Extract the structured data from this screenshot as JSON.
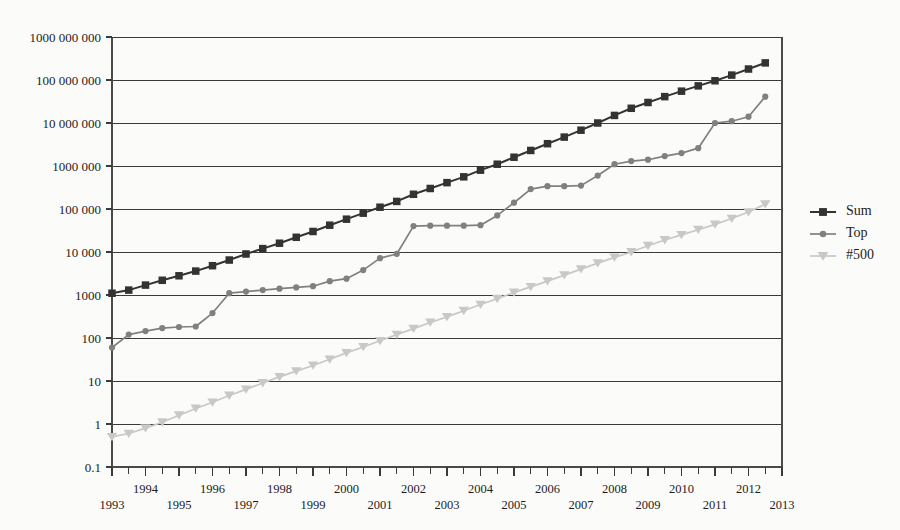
{
  "chart_data": {
    "type": "line",
    "title": "",
    "subtitle": "",
    "xlabel": "",
    "ylabel": "",
    "yscale": "log",
    "ylim": [
      0.1,
      1000000000
    ],
    "xlim": [
      1993,
      2013
    ],
    "grid": "horizontal",
    "legend_position": "right",
    "y_tick_labels": [
      "1000 000 000",
      "100 000 000",
      "10 000 000",
      "1000 000",
      "100 000",
      "10 000",
      "1000",
      "100",
      "10",
      "1",
      "0.1"
    ],
    "y_tick_values": [
      1000000000,
      100000000,
      10000000,
      1000000,
      100000,
      10000,
      1000,
      100,
      10,
      1,
      0.1
    ],
    "x_tick_labels": [
      "1993",
      "1994",
      "1995",
      "1996",
      "1997",
      "1998",
      "1999",
      "2000",
      "2001",
      "2002",
      "2003",
      "2004",
      "2005",
      "2006",
      "2007",
      "2008",
      "2009",
      "2010",
      "2011",
      "2012",
      "2013"
    ],
    "x_tick_values": [
      1993,
      1994,
      1995,
      1996,
      1997,
      1998,
      1999,
      2000,
      2001,
      2002,
      2003,
      2004,
      2005,
      2006,
      2007,
      2008,
      2009,
      2010,
      2011,
      2012,
      2013
    ],
    "x_minor_interval": 0.5,
    "x": [
      1993.0,
      1993.5,
      1994.0,
      1994.5,
      1995.0,
      1995.5,
      1996.0,
      1996.5,
      1997.0,
      1997.5,
      1998.0,
      1998.5,
      1999.0,
      1999.5,
      2000.0,
      2000.5,
      2001.0,
      2001.5,
      2002.0,
      2002.5,
      2003.0,
      2003.5,
      2004.0,
      2004.5,
      2005.0,
      2005.5,
      2006.0,
      2006.5,
      2007.0,
      2007.5,
      2008.0,
      2008.5,
      2009.0,
      2009.5,
      2010.0,
      2010.5,
      2011.0,
      2011.5,
      2012.0,
      2012.5
    ],
    "series": [
      {
        "name": "Sum",
        "color": "#333333",
        "marker": "square",
        "values": [
          1100,
          1300,
          1700,
          2200,
          2800,
          3600,
          4800,
          6500,
          9000,
          12000,
          16000,
          22000,
          30000,
          42000,
          58000,
          80000,
          110000,
          150000,
          220000,
          300000,
          410000,
          560000,
          800000,
          1100000,
          1600000,
          2300000,
          3300000,
          4700000,
          6800000,
          10000000,
          15000000,
          22000000,
          30000000,
          41000000,
          55000000,
          73000000,
          96000000,
          130000000,
          180000000,
          250000000
        ]
      },
      {
        "name": "Top",
        "color": "#808080",
        "marker": "circle",
        "values": [
          60,
          120,
          145,
          170,
          180,
          185,
          380,
          1100,
          1200,
          1300,
          1400,
          1500,
          1600,
          2100,
          2400,
          3800,
          7200,
          9000,
          40000,
          41000,
          41000,
          41000,
          42000,
          71000,
          140000,
          290000,
          340000,
          340000,
          350000,
          600000,
          1100000,
          1300000,
          1400000,
          1700000,
          2000000,
          2600000,
          10000000,
          11000000,
          14000000,
          41000000
        ]
      },
      {
        "name": "#500",
        "color": "#c8c8c8",
        "marker": "triangle",
        "values": [
          0.5,
          0.6,
          0.8,
          1.1,
          1.6,
          2.3,
          3.2,
          4.6,
          6.4,
          9.0,
          12.5,
          17,
          23,
          32,
          45,
          62,
          86,
          120,
          165,
          230,
          310,
          430,
          600,
          820,
          1150,
          1550,
          2100,
          2900,
          4000,
          5500,
          7500,
          10000,
          14000,
          19000,
          25000,
          33000,
          44000,
          60000,
          85000,
          130000
        ]
      }
    ],
    "legend_entries": [
      {
        "label": "Sum",
        "color": "#333333",
        "marker": "square"
      },
      {
        "label": "Top",
        "color": "#808080",
        "marker": "circle"
      },
      {
        "label": "#500",
        "color": "#c8c8c8",
        "marker": "triangle"
      }
    ]
  },
  "colors": {
    "background": "#fbfbfa",
    "axis": "#3a3a3a",
    "grid": "#3a3a3a",
    "text": "#1d1d1d",
    "series_sum": "#333333",
    "series_top": "#808080",
    "series_500": "#c8c8c8"
  }
}
